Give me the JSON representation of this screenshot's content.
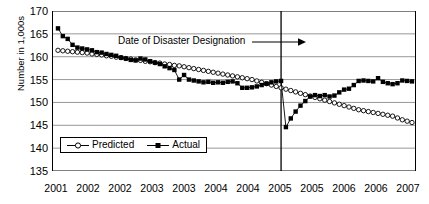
{
  "chart_data": {
    "type": "line",
    "title": "",
    "xlabel": "",
    "ylabel": "Number in 1,000s",
    "ylim": [
      135,
      170
    ],
    "yticks": [
      135,
      140,
      145,
      150,
      155,
      160,
      165,
      170
    ],
    "grid": true,
    "legend_position": "inside-bottom-left",
    "xtick_labels": [
      "2001",
      "2002",
      "2002",
      "2003",
      "2003",
      "2004",
      "2004",
      "2005",
      "2005",
      "2006",
      "2006",
      "2007"
    ],
    "x_minor_ticks": 73,
    "annotations": [
      {
        "text": "Date of Disaster Designation",
        "type": "vertical-line-with-arrow",
        "x_index": 46,
        "x_value": "2005"
      }
    ],
    "series": [
      {
        "name": "Predicted",
        "marker": "open-circle",
        "color": "#000000",
        "values": [
          161.4,
          161.3,
          161.2,
          161.1,
          161.0,
          160.9,
          160.8,
          160.6,
          160.5,
          160.4,
          160.2,
          160.1,
          159.9,
          159.8,
          159.6,
          159.5,
          159.3,
          159.2,
          159.0,
          158.9,
          158.7,
          158.6,
          158.4,
          158.3,
          158.1,
          158.0,
          157.8,
          157.6,
          157.4,
          157.2,
          157.0,
          156.8,
          156.6,
          156.4,
          156.2,
          156.0,
          155.8,
          155.6,
          155.4,
          155.2,
          155.0,
          154.7,
          154.4,
          154.1,
          153.8,
          153.5,
          153.2,
          152.9,
          152.6,
          152.3,
          152.0,
          151.7,
          151.4,
          151.1,
          150.8,
          150.5,
          150.2,
          149.9,
          149.6,
          149.3,
          149.0,
          148.7,
          148.4,
          148.2,
          148.0,
          147.8,
          147.6,
          147.4,
          147.2,
          147.0,
          146.6,
          146.2,
          145.9,
          145.6
        ]
      },
      {
        "name": "Actual",
        "marker": "filled-square",
        "color": "#000000",
        "values": [
          166.2,
          164.5,
          163.9,
          162.6,
          162.0,
          161.8,
          161.6,
          161.4,
          161.0,
          160.9,
          160.6,
          160.4,
          160.2,
          159.8,
          159.6,
          159.3,
          159.2,
          159.6,
          159.4,
          159.0,
          158.7,
          158.4,
          157.9,
          157.5,
          157.1,
          155.0,
          156.0,
          155.0,
          154.8,
          154.6,
          154.4,
          154.5,
          154.3,
          154.4,
          154.3,
          154.5,
          154.6,
          154.2,
          153.2,
          153.2,
          153.3,
          153.5,
          153.8,
          154.1,
          154.4,
          154.6,
          154.7,
          144.6,
          146.5,
          148.0,
          149.3,
          150.3,
          151.3,
          151.6,
          151.4,
          151.6,
          151.3,
          151.5,
          152.2,
          152.8,
          153.0,
          153.8,
          154.7,
          154.8,
          154.7,
          154.6,
          155.3,
          154.5,
          154.2,
          154.0,
          154.2,
          154.8,
          154.7,
          154.6
        ]
      }
    ]
  },
  "legend": {
    "items": [
      {
        "label": "Predicted"
      },
      {
        "label": "Actual"
      }
    ]
  }
}
